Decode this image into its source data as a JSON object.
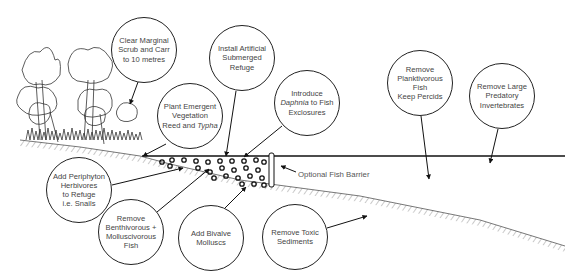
{
  "diagram": {
    "type": "lake restoration measures schematic",
    "water_surface_y": 156,
    "colors": {
      "line": "#222222",
      "text": "#444444",
      "background": "#ffffff"
    }
  },
  "bubbles": [
    {
      "id": "clear-scrub",
      "cx": 144,
      "cy": 50,
      "lines": [
        "Clear Marginal",
        "Scrub and Carr",
        "to 10 metres"
      ],
      "italic": []
    },
    {
      "id": "artificial-refuge",
      "cx": 242,
      "cy": 58,
      "lines": [
        "Install Artificial",
        "Submerged",
        "Refuge"
      ],
      "italic": []
    },
    {
      "id": "emergent-vegetation",
      "cx": 190,
      "cy": 116,
      "lines": [
        "Plant Emergent",
        "Vegetation",
        "Reed and Typha"
      ],
      "italic": [
        "Typha"
      ]
    },
    {
      "id": "daphnia",
      "cx": 307,
      "cy": 103,
      "lines": [
        "Introduce",
        "Daphnia to Fish",
        "Exclosures"
      ],
      "italic": [
        "Daphnia"
      ]
    },
    {
      "id": "planktivorous",
      "cx": 420,
      "cy": 83,
      "lines": [
        "Remove",
        "Planktivorous",
        "Fish",
        "Keep Percids"
      ],
      "italic": []
    },
    {
      "id": "predatory-invertebrates",
      "cx": 502,
      "cy": 96,
      "lines": [
        "Remove Large",
        "Predatory",
        "Invertebrates"
      ],
      "italic": []
    },
    {
      "id": "periphyton",
      "cx": 79,
      "cy": 190,
      "lines": [
        "Add Periphyton",
        "Herbivores",
        "to Refuge",
        "i.e. Snails"
      ],
      "italic": []
    },
    {
      "id": "benthivorous",
      "cx": 131,
      "cy": 232,
      "lines": [
        "Remove",
        "Benthivorous +",
        "Molluscivorous",
        "Fish"
      ],
      "italic": []
    },
    {
      "id": "bivalve",
      "cx": 211,
      "cy": 238,
      "lines": [
        "Add Bivalve",
        "Molluscs"
      ],
      "italic": []
    },
    {
      "id": "toxic-sediments",
      "cx": 295,
      "cy": 237,
      "lines": [
        "Remove Toxic",
        "Sediments"
      ],
      "italic": []
    }
  ],
  "labels": {
    "barrier": "Optional Fish Barrier"
  }
}
